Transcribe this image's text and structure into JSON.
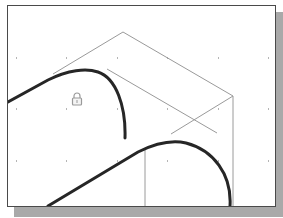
{
  "canvas": {
    "colors": {
      "background": "#ffffff",
      "frame_border": "#4a4a4a",
      "frame_shadow": "#a9a9a9",
      "construction_line": "#9a9a9a",
      "profile_curve": "#262626",
      "grid_dot": "#b5b5b5",
      "lock_icon": "#9a9a9a"
    },
    "grid": {
      "x": [
        8,
        58,
        109,
        159,
        210,
        260
      ],
      "y": [
        52,
        103,
        155
      ]
    },
    "icons": {
      "lock": "lock-icon"
    }
  }
}
